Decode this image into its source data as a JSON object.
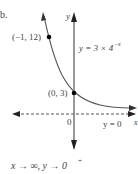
{
  "problem_label": "b.",
  "equation": "y = 3 × 4",
  "equation_exponent": "−x",
  "points": [
    {
      "label": "(−1, 12)",
      "x": -1,
      "y": 12
    },
    {
      "label": "(0, 3)",
      "x": 0,
      "y": 3
    }
  ],
  "axes": {
    "x_label": "x",
    "y_label": "y",
    "origin_label": "0"
  },
  "asymptote_label": "y = 0",
  "limit_text": "x → ∞, y → 0",
  "limit_superscript": "+",
  "colors": {
    "curve": "#555555",
    "axis": "#333333",
    "point": "#000000"
  }
}
